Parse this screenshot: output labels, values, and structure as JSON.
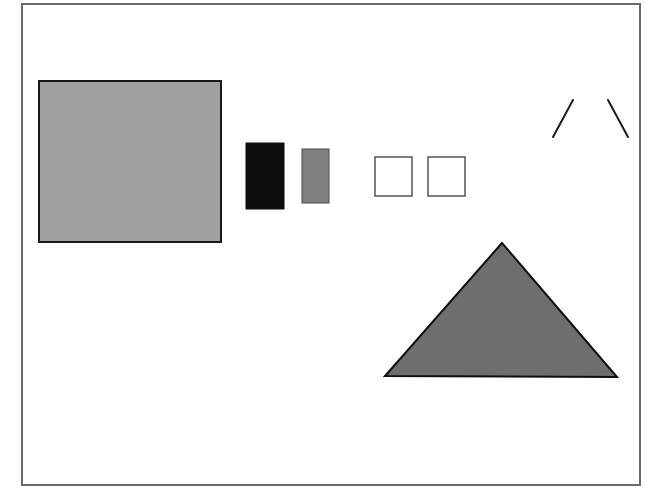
{
  "canvas": {
    "width": 645,
    "height": 494,
    "background": "#ffffff"
  },
  "frame": {
    "x": 21,
    "y": 3,
    "width": 620,
    "height": 483,
    "border_color": "#6a6a6a"
  },
  "shapes": [
    {
      "id": "large-gray-square",
      "type": "rect",
      "x": 39,
      "y": 81,
      "width": 182,
      "height": 161,
      "fill": "#a0a0a0",
      "stroke": "#1a1a1a",
      "stroke_width": 2
    },
    {
      "id": "black-rectangle",
      "type": "rect",
      "x": 246,
      "y": 143,
      "width": 38,
      "height": 66,
      "fill": "#0e0e0e",
      "stroke": "#0e0e0e",
      "stroke_width": 1
    },
    {
      "id": "small-gray-rectangle",
      "type": "rect",
      "x": 302,
      "y": 149,
      "width": 27,
      "height": 54,
      "fill": "#808080",
      "stroke": "#4a4a4a",
      "stroke_width": 1
    },
    {
      "id": "white-square-1",
      "type": "rect",
      "x": 375,
      "y": 157,
      "width": 37,
      "height": 39,
      "fill": "#ffffff",
      "stroke": "#555555",
      "stroke_width": 1.5
    },
    {
      "id": "white-square-2",
      "type": "rect",
      "x": 428,
      "y": 157,
      "width": 37,
      "height": 39,
      "fill": "#ffffff",
      "stroke": "#555555",
      "stroke_width": 1.5
    },
    {
      "id": "slanted-line-left",
      "type": "line",
      "x1": 573,
      "y1": 100,
      "x2": 553,
      "y2": 137,
      "stroke": "#1a1a1a",
      "stroke_width": 2
    },
    {
      "id": "slanted-line-right",
      "type": "line",
      "x1": 608,
      "y1": 100,
      "x2": 628,
      "y2": 137,
      "stroke": "#1a1a1a",
      "stroke_width": 2
    },
    {
      "id": "gray-triangle",
      "type": "polygon",
      "points": "502,243 385,376 617,377",
      "fill": "#6e6e6e",
      "stroke": "#0e0e0e",
      "stroke_width": 2
    }
  ]
}
